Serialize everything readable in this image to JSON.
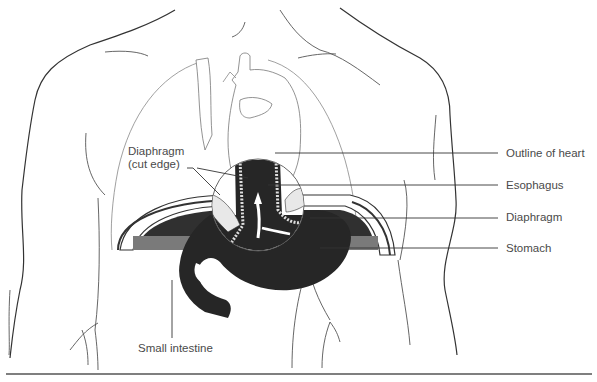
{
  "figure": {
    "type": "anatomical-diagram",
    "colors": {
      "organ_fill": "#262626",
      "diaphragm_band": "#7a7a7a",
      "diaphragm_dark": "#303030",
      "outline_stroke": "#555555",
      "label_text": "#4a4a4a",
      "leader_line": "#333333",
      "background": "#ffffff"
    }
  },
  "labels": {
    "diaphragm_cut_edge_line1": "Diaphragm",
    "diaphragm_cut_edge_line2": "(cut edge)",
    "outline_of_heart": "Outline of heart",
    "esophagus": "Esophagus",
    "diaphragm": "Diaphragm",
    "stomach": "Stomach",
    "small_intestine": "Small intestine"
  }
}
